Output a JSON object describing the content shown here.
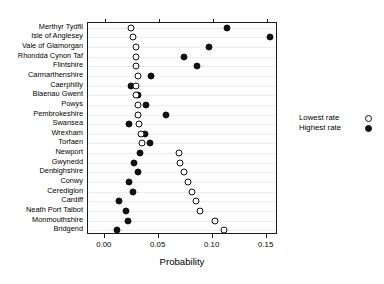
{
  "chart_data": {
    "type": "scatter",
    "title": "",
    "xlabel": "Probability",
    "ylabel": "",
    "xlim": [
      -0.0155,
      0.1605
    ],
    "xticks": [
      0.0,
      0.05,
      0.1,
      0.15
    ],
    "xticklabels": [
      "0.00",
      "0.05",
      "0.10",
      "0.15"
    ],
    "grid": true,
    "legend_position": "right",
    "legend": [
      {
        "name": "Lowest rate",
        "marker": "open-circle"
      },
      {
        "name": "Highest rate",
        "marker": "filled-circle"
      }
    ],
    "categories": [
      "Merthyr Tydfil",
      "Isle of Anglesey",
      "Vale of Glamorgan",
      "Rhondda Cynon Taf",
      "Flintshire",
      "Carmarthenshire",
      "Caerphilly",
      "Blaenau Gwent",
      "Powys",
      "Pembrokeshire",
      "Swansea",
      "Wrexham",
      "Torfaen",
      "Newport",
      "Gwynedd",
      "Denbighshire",
      "Conwy",
      "Ceredigion",
      "Cardiff",
      "Neath Port Talbot",
      "Monmouthshire",
      "Bridgend"
    ],
    "series": [
      {
        "name": "Lowest rate",
        "marker": "open-circle",
        "values": [
          0.0245,
          0.0265,
          0.0285,
          0.0285,
          0.0285,
          0.0305,
          0.029,
          0.029,
          0.0305,
          0.0305,
          0.0315,
          0.034,
          0.0345,
          0.0685,
          0.07,
          0.073,
          0.077,
          0.0805,
          0.0845,
          0.0885,
          0.102,
          0.1105
        ]
      },
      {
        "name": "Highest rate",
        "marker": "filled-circle",
        "values": [
          0.1135,
          0.153,
          0.0965,
          0.073,
          0.0855,
          0.0425,
          0.0245,
          0.031,
          0.0385,
          0.0565,
          0.0225,
          0.0375,
          0.042,
          0.033,
          0.0275,
          0.031,
          0.0225,
          0.0265,
          0.013,
          0.0195,
          0.0215,
          0.011
        ]
      }
    ]
  }
}
